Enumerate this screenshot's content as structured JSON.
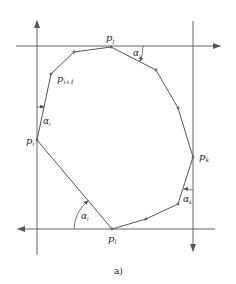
{
  "diagram": {
    "caption": "a)",
    "colors": {
      "stroke": "#555555",
      "text": "#2a2a2a",
      "background": "#ffffff"
    },
    "lines": {
      "top_horizontal": {
        "direction": "right",
        "y": 46
      },
      "bottom_horizontal": {
        "direction": "left",
        "y": 229
      },
      "left_vertical": {
        "direction": "up",
        "x": 37
      },
      "right_vertical": {
        "direction": "down",
        "x": 193
      }
    },
    "points": {
      "p_j": {
        "base": "p",
        "sub": "j"
      },
      "p_k": {
        "base": "p",
        "sub": "k"
      },
      "p_l": {
        "base": "p",
        "sub": "l"
      },
      "p_i": {
        "base": "p",
        "sub": "i"
      },
      "p_i1": {
        "base": "p",
        "sub": "i+1"
      }
    },
    "angles": {
      "alpha_j": {
        "base": "α",
        "sub": "j"
      },
      "alpha_k": {
        "base": "α",
        "sub": "k"
      },
      "alpha_l": {
        "base": "α",
        "sub": "l"
      },
      "alpha_i": {
        "base": "α",
        "sub": "i"
      }
    },
    "polygon_vertices": [
      [
        111,
        47
      ],
      [
        156,
        70
      ],
      [
        178,
        108
      ],
      [
        193,
        157
      ],
      [
        178,
        204
      ],
      [
        146,
        219
      ],
      [
        112,
        229
      ],
      [
        37,
        140
      ],
      [
        51,
        74
      ],
      [
        74,
        52
      ]
    ]
  }
}
